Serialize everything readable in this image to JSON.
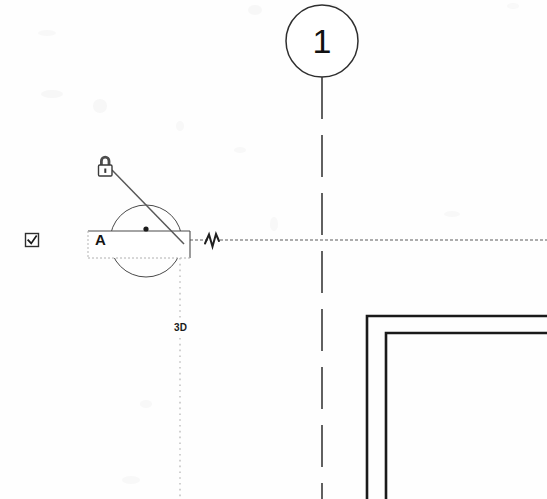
{
  "drawing": {
    "title": "Architectural plan fragment with section callout",
    "background_color": "#fefefe",
    "line_color": "#2b2b2b",
    "wall_color": "#1a1a1a",
    "faint_color": "#9a9a9a"
  },
  "grid_bubble": {
    "name": "grid-line-bubble",
    "label": "1",
    "center_x": 322,
    "center_y": 41,
    "radius": 36
  },
  "section_marker": {
    "name": "section-callout",
    "label": "A",
    "box": {
      "x": 88,
      "y": 231,
      "width": 102,
      "height": 27
    },
    "circle": {
      "center_x": 146,
      "center_y": 241,
      "radius": 36
    }
  },
  "view_tag": {
    "name": "view-direction-tag",
    "label": "3D",
    "x": 180,
    "y": 327
  },
  "lock_icon": {
    "name": "padlock-icon",
    "label": "lock-icon",
    "x": 103,
    "y": 163
  },
  "checkbox": {
    "name": "checkbox-checked-icon",
    "label": "checkbox-checked",
    "x": 32,
    "y": 240,
    "checked": true
  },
  "break_symbol": {
    "name": "break-line-zigzag-icon",
    "label": "zigzag-break",
    "x": 212,
    "y": 240
  },
  "gridlines": {
    "vertical": {
      "name": "vertical-gridline",
      "x": 322,
      "y_start": 77,
      "y_end": 499
    },
    "horizontal": {
      "name": "horizontal-gridline",
      "y": 240,
      "x_start": 190,
      "x_end": 547
    }
  },
  "walls": {
    "outer": {
      "name": "wall-outer-corner",
      "corner_x": 367,
      "corner_y": 316
    },
    "inner": {
      "name": "wall-inner-corner",
      "corner_x": 386,
      "corner_y": 333
    }
  }
}
